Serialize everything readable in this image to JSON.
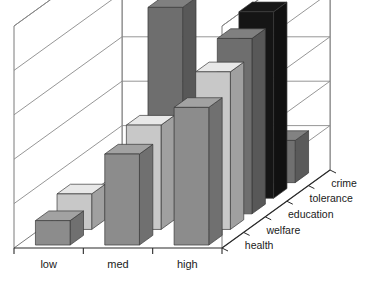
{
  "chart_data": {
    "type": "bar",
    "title": "",
    "subtitle": "",
    "xlabel": "",
    "ylabel": "",
    "zlabel": "",
    "projection": "3d",
    "grid": true,
    "legend_position": "none",
    "categories": [
      "low",
      "med",
      "high"
    ],
    "depth_categories": [
      "health",
      "welfare",
      "education",
      "tolerance",
      "crime"
    ],
    "ylim": [
      0,
      5
    ],
    "y_gridline_count": 5,
    "series": [
      {
        "name": "health",
        "color": "#8c8c8c",
        "values": [
          0.55,
          2.05,
          3.1
        ]
      },
      {
        "name": "welfare",
        "color": "#c8c8c8",
        "values": [
          0.8,
          2.35,
          3.55
        ]
      },
      {
        "name": "education",
        "color": "#6e6e6e",
        "values": [
          0.0,
          4.65,
          3.95
        ]
      },
      {
        "name": "tolerance",
        "color": "#151515",
        "values": [
          0.0,
          0.0,
          4.2
        ]
      },
      {
        "name": "crime",
        "color": "#707070",
        "values": [
          0.0,
          0.0,
          0.95
        ]
      }
    ]
  },
  "axis": {
    "x_tick_labels": [
      "low",
      "med",
      "high"
    ],
    "depth_tick_labels": [
      "health",
      "welfare",
      "education",
      "tolerance",
      "crime"
    ]
  },
  "colors": {
    "frame": "#7a7a7a",
    "gridline": "#8a8a8a",
    "axis": "#2a2a2a",
    "background": "#ffffff",
    "bar_gray_mid": "#8c8c8c",
    "bar_gray_light": "#c8c8c8",
    "bar_gray_dark": "#6e6e6e",
    "bar_black": "#151515",
    "text": "#1a1a1a"
  }
}
